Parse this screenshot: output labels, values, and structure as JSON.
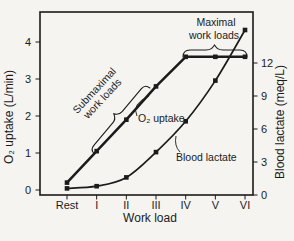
{
  "figure": {
    "background": "#f5f4f1",
    "ink": "#1b1b1b"
  },
  "chart_data": {
    "type": "line",
    "title": "",
    "x_categories": [
      "Rest",
      "I",
      "II",
      "III",
      "IV",
      "V",
      "VI"
    ],
    "xlabel": "Work load",
    "grid": false,
    "legend": "none (inline curve labels)",
    "left_axis": {
      "label": "O₂ uptake (L/min)",
      "ticks": [
        4,
        3,
        2,
        1,
        0
      ],
      "range": [
        0,
        4.8
      ],
      "units": "L/min"
    },
    "right_axis": {
      "label": "Blood lactate (meq/L)",
      "ticks": [
        12,
        9,
        6,
        3,
        0
      ],
      "range": [
        0,
        16.6
      ],
      "units": "meq/L"
    },
    "series": [
      {
        "name": "O₂ uptake",
        "axis": "left",
        "curve": "linear",
        "style": "thick",
        "values": [
          0.2,
          1.05,
          1.9,
          2.8,
          3.6,
          3.6,
          3.6
        ]
      },
      {
        "name": "Blood lactate",
        "axis": "right",
        "curve": "smooth",
        "style": "thin",
        "values": [
          0.6,
          0.8,
          1.6,
          3.9,
          6.7,
          10.4,
          15.0
        ]
      }
    ],
    "annotations": {
      "maximal": {
        "line1": "Maximal",
        "line2": "work loads",
        "brace_span": [
          "IV",
          "VI"
        ]
      },
      "submaximal": {
        "line1": "Submaximal",
        "line2": "work loads",
        "brace_span": [
          "I",
          "III"
        ]
      },
      "o2_label": "O₂ uptake",
      "lactate_label": "Blood lactate"
    }
  }
}
